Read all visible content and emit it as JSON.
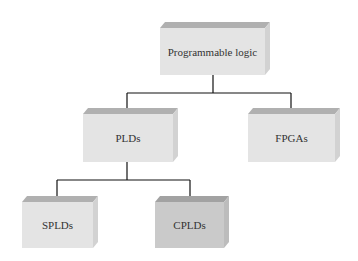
{
  "diagram": {
    "nodes": [
      {
        "id": "root",
        "label": "Programmable logic",
        "shade": "light"
      },
      {
        "id": "plds",
        "label": "PLDs",
        "shade": "light"
      },
      {
        "id": "fpgas",
        "label": "FPGAs",
        "shade": "light"
      },
      {
        "id": "splds",
        "label": "SPLDs",
        "shade": "light"
      },
      {
        "id": "cplds",
        "label": "CPLDs",
        "shade": "dark"
      }
    ],
    "edges": [
      {
        "from": "root",
        "to": "plds"
      },
      {
        "from": "root",
        "to": "fpgas"
      },
      {
        "from": "plds",
        "to": "splds"
      },
      {
        "from": "plds",
        "to": "cplds"
      }
    ]
  },
  "colors": {
    "light_front": "#e4e4e4",
    "light_top": "#b0b0b0",
    "light_side": "#d2d2d2",
    "dark_front": "#cacaca",
    "dark_top": "#a2a2a2",
    "dark_side": "#bcbcbc",
    "line": "#111111",
    "text": "#333333"
  }
}
